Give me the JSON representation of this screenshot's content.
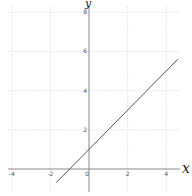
{
  "chart_data": {
    "type": "line",
    "title": "",
    "xlabel": "x",
    "ylabel": "y",
    "xlim": [
      -4.5,
      4.8
    ],
    "ylim": [
      -1.2,
      8.6
    ],
    "grid": true,
    "x_ticks": [
      -4,
      -2,
      0,
      2,
      4
    ],
    "y_ticks": [
      2,
      4,
      6,
      8
    ],
    "x_tick_labels": [
      "-4",
      "-2",
      "0",
      "2",
      "4"
    ],
    "y_tick_labels": [
      "2",
      "4",
      "6",
      "8"
    ],
    "series": [
      {
        "name": "y = x + 1",
        "x": [
          -1.7,
          4.6
        ],
        "y": [
          -0.7,
          5.6
        ],
        "color": "#555555"
      }
    ],
    "legend": "none"
  },
  "colors": {
    "grid": "#e4e4e4",
    "axis": "#888888",
    "line": "#555555",
    "background": "#ffffff"
  }
}
